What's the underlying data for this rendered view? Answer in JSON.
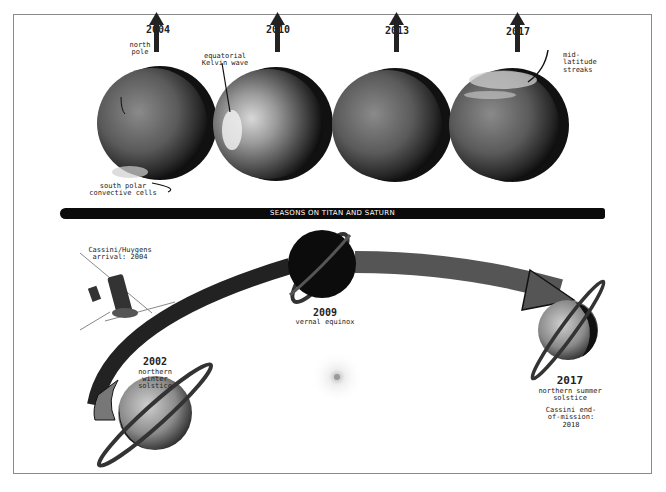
{
  "title": "SEASONS ON TITAN AND SATURN",
  "titan_views": [
    {
      "year": "2004",
      "annotations": [
        "north pole",
        "south polar convective cells"
      ]
    },
    {
      "year": "2010",
      "annotations": [
        "equatorial Kelvin wave"
      ]
    },
    {
      "year": "2013",
      "annotations": []
    },
    {
      "year": "2017",
      "annotations": [
        "mid-latitude streaks"
      ]
    }
  ],
  "annotations": {
    "north_pole": "north pole",
    "south_polar": "south polar convective cells",
    "kelvin_wave": "equatorial Kelvin wave",
    "mid_latitude": "mid-latitude streaks"
  },
  "saturn_positions": [
    {
      "year": "2002",
      "event": "northern winter solstice"
    },
    {
      "year": "2009",
      "event": "vernal equinox"
    },
    {
      "year": "2017",
      "event": "northern summer solstice"
    }
  ],
  "spacecraft": {
    "label": "Cassini/Huygens arrival: 2004"
  },
  "mission_end": {
    "label": "Cassini end-of-mission: 2018"
  },
  "colors": {
    "sphere_dark": "#1e1e1e",
    "sphere_mid": "#5a5a5a",
    "arrow": "#4a4a4a",
    "banner": "#0b0b0b"
  }
}
